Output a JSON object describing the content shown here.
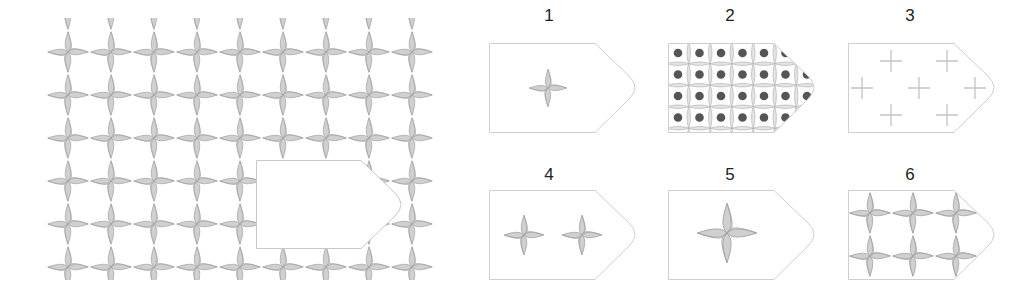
{
  "puzzle": {
    "description": "Pattern with missing piece",
    "pattern": {
      "motif": "four-point-star",
      "fill": "#cfcfcf",
      "stroke": "#a9a9a9",
      "columns": 9,
      "rows": 6,
      "spacing_x": 43,
      "spacing_y": 43,
      "origin_x": 68,
      "origin_y": 52
    },
    "missing_region": {
      "x": 256,
      "y": 160,
      "width": 147,
      "height": 89
    }
  },
  "options": [
    {
      "label": "1",
      "content": "single small star, centered"
    },
    {
      "label": "2",
      "content": "dense grid of dark dots with gray crosses"
    },
    {
      "label": "3",
      "content": "thin light-gray plus signs"
    },
    {
      "label": "4",
      "content": "two small stars"
    },
    {
      "label": "5",
      "content": "single large star"
    },
    {
      "label": "6",
      "content": "six stars in two rows"
    }
  ],
  "colors": {
    "star_fill": "#cfcfcf",
    "star_stroke": "#9e9e9e",
    "border": "#c8c8c8",
    "dot": "#555555",
    "label": "#222222"
  }
}
